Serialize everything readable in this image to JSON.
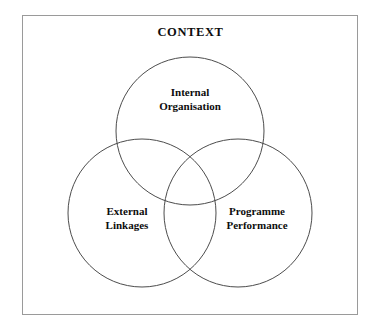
{
  "diagram": {
    "type": "venn-3-circle",
    "frame_label": "CONTEXT",
    "background_color": "#ffffff",
    "frame_border_color": "#9a9a9a",
    "circle_stroke_color": "#4c4c4c",
    "text_color": "#0d0d0d",
    "circles": [
      {
        "id": "internal-organisation",
        "position": "top",
        "line1": "Internal",
        "line2": "Organisation",
        "cx": 190,
        "cy": 131,
        "r": 74
      },
      {
        "id": "external-linkages",
        "position": "bottom-left",
        "line1": "External",
        "line2": "Linkages",
        "cx": 142,
        "cy": 213,
        "r": 74
      },
      {
        "id": "programme-performance",
        "position": "bottom-right",
        "line1": "Programme",
        "line2": "Performance",
        "cx": 238,
        "cy": 213,
        "r": 74
      }
    ]
  }
}
